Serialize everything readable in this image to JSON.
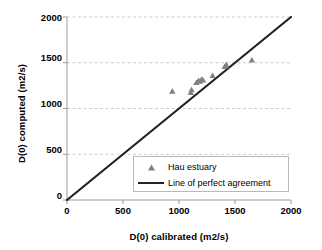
{
  "chart_data": {
    "type": "scatter",
    "title": "",
    "xlabel": "D(0) calibrated (m2/s)",
    "ylabel": "D(0) computed (m2/s)",
    "xlim": [
      0,
      2000
    ],
    "ylim": [
      0,
      2000
    ],
    "xticks": [
      0,
      500,
      1000,
      1500,
      2000
    ],
    "yticks": [
      0,
      500,
      1000,
      1500,
      2000
    ],
    "xtick_labels": [
      "0",
      "500",
      "1000",
      "1500",
      "2000"
    ],
    "ytick_labels": [
      "0",
      "500",
      "1000",
      "1500",
      "2000"
    ],
    "grid": "horizontal-dashed",
    "legend_position": "lower-center",
    "series": [
      {
        "name": "Hau estuary",
        "type": "scatter",
        "marker": "triangle",
        "color": "#808080",
        "points": [
          [
            940,
            1190
          ],
          [
            1105,
            1175
          ],
          [
            1112,
            1205
          ],
          [
            1155,
            1285
          ],
          [
            1175,
            1307
          ],
          [
            1188,
            1298
          ],
          [
            1202,
            1320
          ],
          [
            1215,
            1312
          ],
          [
            1300,
            1360
          ],
          [
            1408,
            1460
          ],
          [
            1422,
            1480
          ],
          [
            1650,
            1530
          ]
        ]
      },
      {
        "name": "Line of perfect agreement",
        "type": "line",
        "color": "#222222",
        "x": [
          0,
          2000
        ],
        "y": [
          0,
          2000
        ]
      }
    ],
    "legend": [
      {
        "label": "Hau estuary",
        "key": "triangle-marker",
        "color": "#808080"
      },
      {
        "label": "Line of perfect agreement",
        "key": "line-swatch",
        "color": "#222222"
      }
    ]
  },
  "colors": {
    "marker": "#808080",
    "line": "#222222",
    "axis": "#9a9a9a",
    "grid": "#bfbfbf",
    "background": "#ffffff",
    "text": "#000000"
  }
}
